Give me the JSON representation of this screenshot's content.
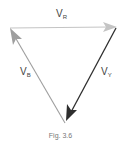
{
  "diagram": {
    "type": "phasor-triangle",
    "vectors": [
      {
        "id": "VR",
        "symbol": "V",
        "subscript": "R",
        "from": [
          10,
          28
        ],
        "to": [
          116,
          27
        ],
        "color": "#b8b8b8"
      },
      {
        "id": "VY",
        "symbol": "V",
        "subscript": "Y",
        "from": [
          116,
          27
        ],
        "to": [
          65,
          123
        ],
        "color": "#333333"
      },
      {
        "id": "VB",
        "symbol": "V",
        "subscript": "B",
        "from": [
          65,
          123
        ],
        "to": [
          10,
          28
        ],
        "color": "#a8a8a8"
      }
    ],
    "labels": {
      "vr": {
        "main": "V",
        "sub": "R"
      },
      "vy": {
        "main": "V",
        "sub": "Y"
      },
      "vb": {
        "main": "V",
        "sub": "B"
      }
    },
    "caption": "Fig. 3.6"
  }
}
